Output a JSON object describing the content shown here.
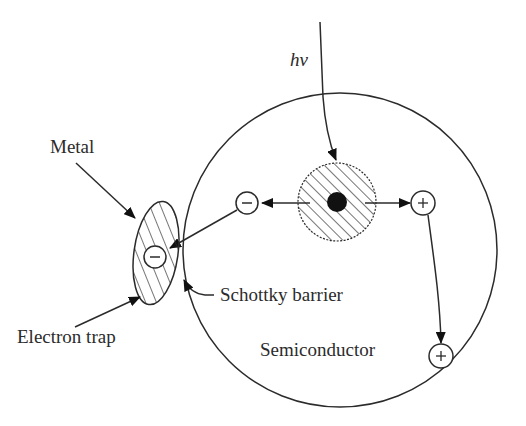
{
  "figure": {
    "type": "schematic",
    "labels": {
      "photon": "hv",
      "metal": "Metal",
      "electron_trap": "Electron trap",
      "schottky_barrier": "Schottky barrier",
      "semiconductor": "Semiconductor"
    },
    "charges": {
      "electron_symbol": "−",
      "hole_symbol": "+"
    },
    "colors": {
      "ink": "#2b2b2b",
      "background": "#ffffff",
      "core": "#111111"
    },
    "elements": [
      {
        "id": "semiconductor-particle",
        "shape": "circle",
        "cx": 340,
        "cy": 250,
        "r": 157
      },
      {
        "id": "excitation-zone",
        "shape": "hatched-circle",
        "cx": 337,
        "cy": 202,
        "r": 39
      },
      {
        "id": "metal-island",
        "shape": "hatched-ellipse",
        "cx": 156,
        "cy": 253,
        "rx": 22,
        "ry": 52
      },
      {
        "id": "electron-1",
        "charge": "−",
        "cx": 247,
        "cy": 203
      },
      {
        "id": "electron-trapped",
        "charge": "−",
        "cx": 155,
        "cy": 257
      },
      {
        "id": "hole-1",
        "charge": "+",
        "cx": 423,
        "cy": 203
      },
      {
        "id": "hole-2",
        "charge": "+",
        "cx": 441,
        "cy": 356
      }
    ]
  }
}
